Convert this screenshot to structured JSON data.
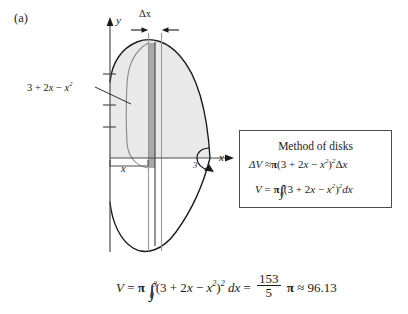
{
  "figure": {
    "panel_label": "(a)",
    "background_color": "#ffffff",
    "ink_color": "#1a1a1a"
  },
  "diagram": {
    "axis": {
      "y_label": "y",
      "x_label": "x",
      "x_upper_bound_label": "3",
      "tick_count": 3
    },
    "slice": {
      "delta_x_label": "Δx",
      "width_label": "x",
      "fill_color": "#a9a9a9",
      "edge_color": "#4c4c4c"
    },
    "region": {
      "fill_color": "#e9e9e9",
      "outline_color": "#1a1a1a"
    },
    "curve_callout": {
      "text_parts": [
        "3 + 2",
        "x",
        " − ",
        "x",
        "2"
      ],
      "full_text": "3 + 2x − x²"
    },
    "revolution_arrow_name": "rotation-arrow"
  },
  "disks_box": {
    "title": "Method of disks",
    "equation_delta_v": {
      "lhs": "ΔV",
      "relation": "≈",
      "pi": "π",
      "open": "(3 + 2",
      "var1": "x",
      "minus": " − ",
      "var2": "x",
      "exp_inner": "2",
      "close": ")",
      "exp_outer": "2",
      "tail_delta": "Δ",
      "tail_var": "x"
    },
    "equation_volume": {
      "lhs": "V",
      "relation": "=",
      "pi": "π",
      "limit_upper": "3",
      "limit_lower": "0",
      "open": "(3 + 2",
      "var1": "x",
      "minus": " − ",
      "var2": "x",
      "exp_inner": "2",
      "close": ")",
      "exp_outer": "2",
      "differential": "dx"
    }
  },
  "result_equation": {
    "lhs": "V",
    "equals_1": "=",
    "pi_1": "π",
    "limit_upper": "3",
    "limit_lower": "0",
    "open": "(3 + 2",
    "var1": "x",
    "minus": " − ",
    "var2": "x",
    "exp_inner": "2",
    "close": ")",
    "exp_outer": "2",
    "differential": "dx",
    "equals_2": "=",
    "fraction_numerator": "153",
    "fraction_denominator": "5",
    "pi_2": "π",
    "approx": "≈",
    "value": "96.13"
  }
}
